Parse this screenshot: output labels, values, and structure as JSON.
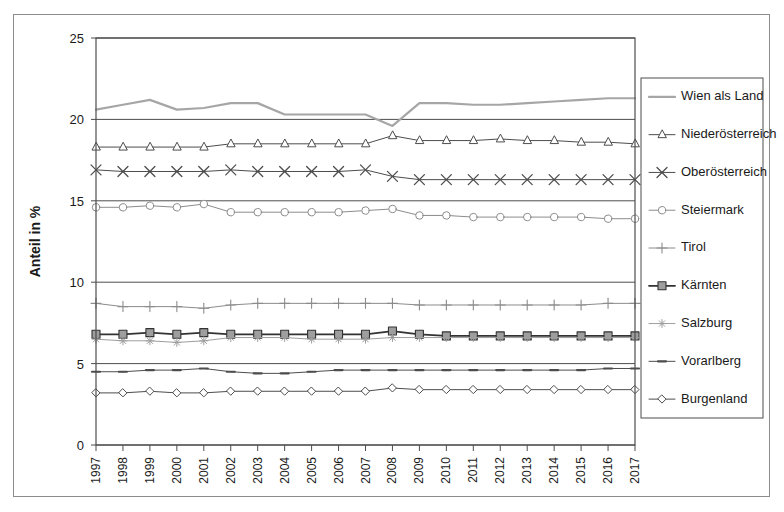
{
  "chart_data": {
    "type": "line",
    "title": "",
    "xlabel": "",
    "ylabel": "Anteil in %",
    "ylim": [
      0,
      25
    ],
    "yticks": [
      0,
      5,
      10,
      15,
      20,
      25
    ],
    "grid": true,
    "legend_position": "right",
    "categories": [
      "1997",
      "1998",
      "1999",
      "2000",
      "2001",
      "2002",
      "2003",
      "2004",
      "2005",
      "2006",
      "2007",
      "2008",
      "2009",
      "2010",
      "2011",
      "2012",
      "2013",
      "2014",
      "2015",
      "2016",
      "2017"
    ],
    "series": [
      {
        "name": "Wien als Land",
        "marker": "none",
        "color": "#a6a6a6",
        "line_width": 2.2,
        "values": [
          20.6,
          20.9,
          21.2,
          20.6,
          20.7,
          21.0,
          21.0,
          20.3,
          20.3,
          20.3,
          20.3,
          19.6,
          21.0,
          21.0,
          20.9,
          20.9,
          21.0,
          21.1,
          21.2,
          21.3,
          21.3
        ]
      },
      {
        "name": "Niederösterreich",
        "marker": "triangle-open",
        "color": "#4d4d4d",
        "line_width": 1,
        "values": [
          18.3,
          18.3,
          18.3,
          18.3,
          18.3,
          18.5,
          18.5,
          18.5,
          18.5,
          18.5,
          18.5,
          19.0,
          18.7,
          18.7,
          18.7,
          18.8,
          18.7,
          18.7,
          18.6,
          18.6,
          18.5
        ]
      },
      {
        "name": "Oberösterreich",
        "marker": "x-cross",
        "color": "#4d4d4d",
        "line_width": 1,
        "values": [
          16.9,
          16.8,
          16.8,
          16.8,
          16.8,
          16.9,
          16.8,
          16.8,
          16.8,
          16.8,
          16.9,
          16.5,
          16.3,
          16.3,
          16.3,
          16.3,
          16.3,
          16.3,
          16.3,
          16.3,
          16.3
        ]
      },
      {
        "name": "Steiermark",
        "marker": "circle-open",
        "color": "#8c8c8c",
        "line_width": 1,
        "values": [
          14.6,
          14.6,
          14.7,
          14.6,
          14.8,
          14.3,
          14.3,
          14.3,
          14.3,
          14.3,
          14.4,
          14.5,
          14.1,
          14.1,
          14.0,
          14.0,
          14.0,
          14.0,
          14.0,
          13.9,
          13.9
        ]
      },
      {
        "name": "Tirol",
        "marker": "plus",
        "color": "#8c8c8c",
        "line_width": 1,
        "values": [
          8.7,
          8.5,
          8.5,
          8.5,
          8.4,
          8.6,
          8.7,
          8.7,
          8.7,
          8.7,
          8.7,
          8.7,
          8.6,
          8.6,
          8.6,
          8.6,
          8.6,
          8.6,
          8.6,
          8.7,
          8.7
        ]
      },
      {
        "name": "Kärnten",
        "marker": "square-filled",
        "color": "#333333",
        "line_width": 1.8,
        "values": [
          6.8,
          6.8,
          6.9,
          6.8,
          6.9,
          6.8,
          6.8,
          6.8,
          6.8,
          6.8,
          6.8,
          7.0,
          6.8,
          6.7,
          6.7,
          6.7,
          6.7,
          6.7,
          6.7,
          6.7,
          6.7
        ]
      },
      {
        "name": "Salzburg",
        "marker": "asterisk",
        "color": "#9e9e9e",
        "line_width": 1,
        "values": [
          6.5,
          6.4,
          6.4,
          6.3,
          6.4,
          6.6,
          6.6,
          6.6,
          6.5,
          6.5,
          6.5,
          6.6,
          6.6,
          6.6,
          6.6,
          6.6,
          6.6,
          6.6,
          6.6,
          6.6,
          6.6
        ]
      },
      {
        "name": "Vorarlberg",
        "marker": "dash",
        "color": "#4d4d4d",
        "line_width": 1,
        "values": [
          4.5,
          4.5,
          4.6,
          4.6,
          4.7,
          4.5,
          4.4,
          4.4,
          4.5,
          4.6,
          4.6,
          4.6,
          4.6,
          4.6,
          4.6,
          4.6,
          4.6,
          4.6,
          4.6,
          4.7,
          4.7
        ]
      },
      {
        "name": "Burgenland",
        "marker": "diamond-open",
        "color": "#4d4d4d",
        "line_width": 1,
        "values": [
          3.2,
          3.2,
          3.3,
          3.2,
          3.2,
          3.3,
          3.3,
          3.3,
          3.3,
          3.3,
          3.3,
          3.5,
          3.4,
          3.4,
          3.4,
          3.4,
          3.4,
          3.4,
          3.4,
          3.4,
          3.4
        ]
      }
    ]
  },
  "axes": {
    "y_axis_title": "Anteil in %",
    "y_tick_labels": [
      "0",
      "5",
      "10",
      "15",
      "20",
      "25"
    ],
    "x_tick_labels": [
      "1997",
      "1998",
      "1999",
      "2000",
      "2001",
      "2002",
      "2003",
      "2004",
      "2005",
      "2006",
      "2007",
      "2008",
      "2009",
      "2010",
      "2011",
      "2012",
      "2013",
      "2014",
      "2015",
      "2016",
      "2017"
    ]
  },
  "legend": {
    "entries": [
      {
        "label": "Wien als Land",
        "icon": "line-swatch-icon"
      },
      {
        "label": "Niederösterreich",
        "icon": "triangle-marker-icon"
      },
      {
        "label": "Oberösterreich",
        "icon": "x-cross-marker-icon"
      },
      {
        "label": "Steiermark",
        "icon": "circle-marker-icon"
      },
      {
        "label": "Tirol",
        "icon": "plus-marker-icon"
      },
      {
        "label": "Kärnten",
        "icon": "square-marker-icon"
      },
      {
        "label": "Salzburg",
        "icon": "asterisk-marker-icon"
      },
      {
        "label": "Vorarlberg",
        "icon": "dash-marker-icon"
      },
      {
        "label": "Burgenland",
        "icon": "diamond-marker-icon"
      }
    ]
  },
  "colors": {
    "frame": "#4d4d4d",
    "outer_frame": "#8c8c8c",
    "background": "#ffffff",
    "text": "#1a1a1a"
  }
}
